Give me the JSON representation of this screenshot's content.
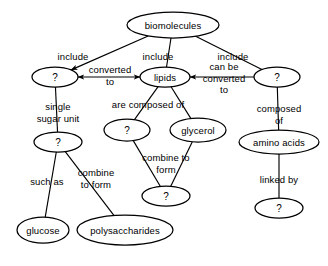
{
  "diagram": {
    "stroke_color": "#000000",
    "background_color": "#ffffff",
    "nodes": [
      {
        "id": "biomolecules",
        "label": "biomolecules",
        "cx": 173,
        "cy": 25,
        "rx": 46,
        "ry": 13
      },
      {
        "id": "carbohydrates_q",
        "label": "?",
        "cx": 55,
        "cy": 77,
        "rx": 23,
        "ry": 10
      },
      {
        "id": "lipids",
        "label": "lipids",
        "cx": 165,
        "cy": 77,
        "rx": 25,
        "ry": 10
      },
      {
        "id": "proteins_q",
        "label": "?",
        "cx": 277,
        "cy": 77,
        "rx": 23,
        "ry": 10
      },
      {
        "id": "monosaccharide_q",
        "label": "?",
        "cx": 58,
        "cy": 142,
        "rx": 24,
        "ry": 10
      },
      {
        "id": "fattyacids_q",
        "label": "?",
        "cx": 127,
        "cy": 130,
        "rx": 23,
        "ry": 11
      },
      {
        "id": "glycerol",
        "label": "glycerol",
        "cx": 198,
        "cy": 130,
        "rx": 28,
        "ry": 12
      },
      {
        "id": "amino_acids",
        "label": "amino acids",
        "cx": 279,
        "cy": 142,
        "rx": 40,
        "ry": 12
      },
      {
        "id": "triglyceride_q",
        "label": "?",
        "cx": 166,
        "cy": 196,
        "rx": 24,
        "ry": 10
      },
      {
        "id": "peptidebond_q",
        "label": "?",
        "cx": 279,
        "cy": 208,
        "rx": 24,
        "ry": 10
      },
      {
        "id": "glucose",
        "label": "glucose",
        "cx": 43,
        "cy": 230,
        "rx": 26,
        "ry": 13
      },
      {
        "id": "polysaccharides",
        "label": "polysaccharides",
        "cx": 125,
        "cy": 230,
        "rx": 48,
        "ry": 15
      }
    ],
    "link_labels": [
      {
        "id": "include-left",
        "lines": [
          "include"
        ],
        "x": 73,
        "y": 57
      },
      {
        "id": "include-middle",
        "lines": [
          "include"
        ],
        "x": 158,
        "y": 57
      },
      {
        "id": "include-right",
        "lines": [
          "include"
        ],
        "x": 233,
        "y": 57
      },
      {
        "id": "converted-to",
        "lines": [
          "converted",
          "to"
        ],
        "x": 110,
        "y": 75
      },
      {
        "id": "can-be-converted-to",
        "lines": [
          "can be",
          "converted",
          "to"
        ],
        "x": 224,
        "y": 78
      },
      {
        "id": "single-sugar-unit",
        "lines": [
          "single",
          "sugar unit"
        ],
        "x": 58,
        "y": 112
      },
      {
        "id": "are-composed-of",
        "lines": [
          "are composed of"
        ],
        "x": 148,
        "y": 105
      },
      {
        "id": "composed-of",
        "lines": [
          "composed",
          "of"
        ],
        "x": 279,
        "y": 114
      },
      {
        "id": "such-as",
        "lines": [
          "such as"
        ],
        "x": 47,
        "y": 182
      },
      {
        "id": "combine-to-form-1",
        "lines": [
          "combine",
          "to form"
        ],
        "x": 96,
        "y": 178
      },
      {
        "id": "combine-to-form-2",
        "lines": [
          "combine to",
          "form"
        ],
        "x": 166,
        "y": 163
      },
      {
        "id": "linked-by",
        "lines": [
          "linked by"
        ],
        "x": 279,
        "y": 180
      }
    ],
    "edges": [
      {
        "id": "biomolecules-to-carbohydrates",
        "from": "biomolecules",
        "to": "carbohydrates_q",
        "arrow": "end"
      },
      {
        "id": "biomolecules-to-lipids",
        "from": "biomolecules",
        "to": "lipids",
        "arrow": "none"
      },
      {
        "id": "biomolecules-to-proteins",
        "from": "biomolecules",
        "to": "proteins_q",
        "arrow": "none"
      },
      {
        "id": "carbohydrates-lipids",
        "from": "carbohydrates_q",
        "to": "lipids",
        "arrow": "both"
      },
      {
        "id": "proteins-lipids",
        "from": "proteins_q",
        "to": "lipids",
        "arrow": "end"
      },
      {
        "id": "carbohydrates-to-monosacch",
        "from": "carbohydrates_q",
        "to": "monosaccharide_q",
        "arrow": "none"
      },
      {
        "id": "lipids-to-fattyacids",
        "from": "lipids",
        "to": "fattyacids_q",
        "arrow": "none"
      },
      {
        "id": "lipids-to-glycerol",
        "from": "lipids",
        "to": "glycerol",
        "arrow": "none"
      },
      {
        "id": "proteins-to-aminoacids",
        "from": "proteins_q",
        "to": "amino_acids",
        "arrow": "none"
      },
      {
        "id": "monosacch-to-glucose",
        "from": "monosaccharide_q",
        "to": "glucose",
        "arrow": "none"
      },
      {
        "id": "monosacch-to-polysacch",
        "from": "monosaccharide_q",
        "to": "polysaccharides",
        "arrow": "none"
      },
      {
        "id": "fattyacids-to-triglyceride",
        "from": "fattyacids_q",
        "to": "triglyceride_q",
        "arrow": "none"
      },
      {
        "id": "glycerol-to-triglyceride",
        "from": "glycerol",
        "to": "triglyceride_q",
        "arrow": "none"
      },
      {
        "id": "aminoacids-to-peptidebond",
        "from": "amino_acids",
        "to": "peptidebond_q",
        "arrow": "none"
      }
    ]
  }
}
